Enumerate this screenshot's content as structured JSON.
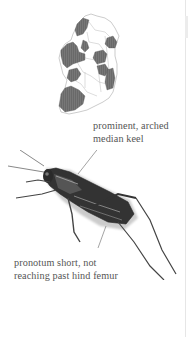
{
  "figure": {
    "map": {
      "subject": "distribution-map-ireland",
      "fill_color": "#6a6a6a",
      "outline_color": "#999999"
    },
    "illustration": {
      "subject": "grasshopper"
    },
    "annotations": [
      {
        "id": "keel",
        "lines": [
          "prominent, arched",
          "median keel"
        ]
      },
      {
        "id": "pronotum",
        "lines": [
          "pronotum short, not",
          "reaching past hind femur"
        ]
      }
    ]
  }
}
